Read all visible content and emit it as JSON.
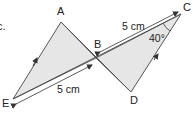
{
  "diagram": {
    "partial_text": "c.",
    "points": {
      "A": {
        "label": "A",
        "x": 61,
        "y": 22
      },
      "B": {
        "label": "B",
        "x": 96,
        "y": 58
      },
      "C": {
        "label": "C",
        "x": 181,
        "y": 14
      },
      "D": {
        "label": "D",
        "x": 131,
        "y": 92
      },
      "E": {
        "label": "E",
        "x": 13,
        "y": 99
      }
    },
    "measurements": {
      "BC": "5 cm",
      "EB": "5 cm",
      "angle_C": "40°"
    },
    "colors": {
      "fill": "#e6e6e6",
      "stroke": "#555555",
      "text": "#222222"
    }
  }
}
